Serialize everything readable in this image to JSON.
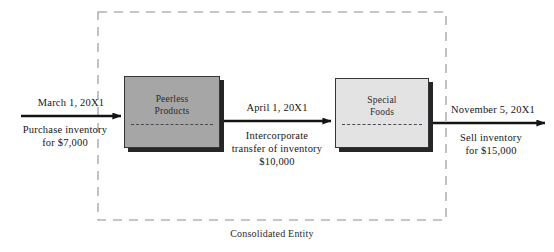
{
  "diagram": {
    "caption": "Consolidated Entity",
    "boundary": {
      "name": "consolidated-entity-boundary",
      "style": "dashed"
    },
    "entities": [
      {
        "id": "peerless",
        "line1": "Peerless",
        "line2": "Products",
        "fill": "#a6a6a6"
      },
      {
        "id": "special-foods",
        "line1": "Special",
        "line2": "Foods",
        "fill": "#e3e3e3"
      }
    ],
    "events": [
      {
        "id": "purchase",
        "date": "March 1, 20X1",
        "desc_line1": "Purchase inventory",
        "desc_line2": "for $7,000",
        "amount": "$7,000"
      },
      {
        "id": "intercorporate-transfer",
        "date": "April 1, 20X1",
        "desc_line1": "Intercorporate",
        "desc_line2": "transfer of inventory",
        "desc_line3": "$10,000",
        "amount": "$10,000"
      },
      {
        "id": "sell",
        "date": "November 5, 20X1",
        "desc_line1": "Sell inventory",
        "desc_line2": "for $15,000",
        "amount": "$15,000"
      }
    ],
    "colors": {
      "arrow": "#141414",
      "boundary": "#8e8e93",
      "peerless_fill": "#a6a6a6",
      "special_foods_fill": "#e3e3e3",
      "box_shadow": "#262628"
    }
  }
}
